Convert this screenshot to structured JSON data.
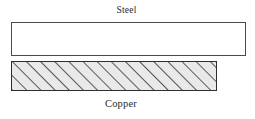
{
  "figure": {
    "background_color": "#ffffff",
    "width": 255,
    "height": 119
  },
  "labels": {
    "top": "Steel",
    "bottom": "Copper"
  },
  "layers": [
    {
      "name": "steel",
      "label": "Steel",
      "fill": "white",
      "fill_color": "#ffffff",
      "border_color": "#4a4a4a",
      "pattern": "none",
      "x": 11,
      "y": 22,
      "width": 235,
      "height": 34
    },
    {
      "name": "copper",
      "label": "Copper",
      "fill": "hatched",
      "fill_color": "#e9e9e9",
      "border_color": "#2e2e2e",
      "pattern": "diagonal-hatch-45",
      "hatch_color": "#333333",
      "hatch_spacing": 10,
      "x": 11,
      "y": 61,
      "width": 206,
      "height": 30
    }
  ]
}
